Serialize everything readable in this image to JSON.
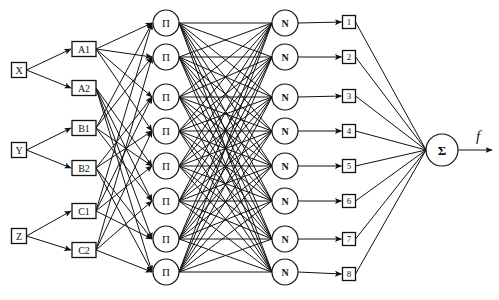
{
  "diagram": {
    "type": "anfis-network",
    "inputs": [
      {
        "id": "X",
        "label": "X",
        "x": 19,
        "y": 70
      },
      {
        "id": "Y",
        "label": "Y",
        "x": 19,
        "y": 150
      },
      {
        "id": "Z",
        "label": "Z",
        "x": 19,
        "y": 236
      }
    ],
    "membership": [
      {
        "id": "A1",
        "label": "A1",
        "input": "X",
        "x": 84,
        "y": 49,
        "to": [
          0,
          1,
          2,
          3
        ]
      },
      {
        "id": "A2",
        "label": "A2",
        "input": "X",
        "x": 84,
        "y": 88,
        "to": [
          4,
          5,
          6,
          7
        ]
      },
      {
        "id": "B1",
        "label": "B1",
        "input": "Y",
        "x": 84,
        "y": 128,
        "to": [
          0,
          1,
          4,
          5
        ]
      },
      {
        "id": "B2",
        "label": "B2",
        "input": "Y",
        "x": 84,
        "y": 168,
        "to": [
          2,
          3,
          6,
          7
        ]
      },
      {
        "id": "C1",
        "label": "C1",
        "input": "Z",
        "x": 84,
        "y": 211,
        "to": [
          0,
          2,
          4,
          6
        ]
      },
      {
        "id": "C2",
        "label": "C2",
        "input": "Z",
        "x": 84,
        "y": 250,
        "to": [
          1,
          3,
          5,
          7
        ]
      }
    ],
    "product_nodes": {
      "label": "Π",
      "x": 166,
      "ys": [
        23,
        57,
        97,
        131,
        166,
        201,
        239,
        272
      ]
    },
    "norm_nodes": {
      "label": "N",
      "x": 285,
      "ys": [
        23,
        57,
        97,
        131,
        166,
        201,
        239,
        272
      ]
    },
    "rule_outputs": {
      "labels": [
        "1",
        "2",
        "3",
        "4",
        "5",
        "6",
        "7",
        "8"
      ],
      "x": 349,
      "ys": [
        22,
        57,
        96,
        131,
        166,
        201,
        239,
        274
      ]
    },
    "sum_node": {
      "label": "Σ",
      "x": 442,
      "y": 150
    },
    "output": {
      "label": "f"
    }
  }
}
